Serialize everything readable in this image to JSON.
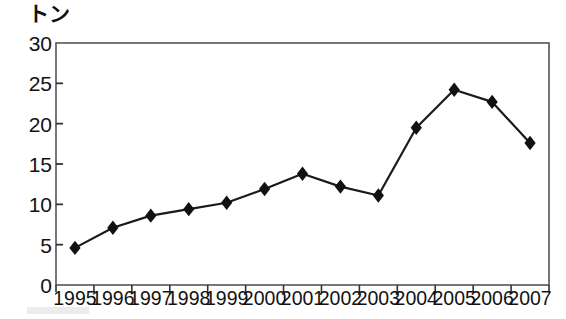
{
  "chart_data": {
    "type": "line",
    "title": "",
    "subtitle": "",
    "xlabel": "",
    "ylabel": "トン",
    "unit_label": "トン",
    "categories": [
      "1995",
      "1996",
      "1997",
      "1998",
      "1999",
      "2000",
      "2001",
      "2002",
      "2003",
      "2004",
      "2005",
      "2006",
      "2007"
    ],
    "values": [
      4.6,
      7.1,
      8.6,
      9.4,
      10.2,
      11.9,
      13.8,
      12.2,
      11.1,
      19.5,
      24.2,
      22.7,
      17.6
    ],
    "series": [
      {
        "name": "トン",
        "values": [
          4.6,
          7.1,
          8.6,
          9.4,
          10.2,
          11.9,
          13.8,
          12.2,
          11.1,
          19.5,
          24.2,
          22.7,
          17.6
        ]
      }
    ],
    "ylim": [
      0,
      30
    ],
    "yticks": [
      0,
      5,
      10,
      15,
      20,
      25,
      30
    ],
    "ytick_labels": [
      "0",
      "5",
      "10",
      "15",
      "20",
      "25",
      "30"
    ],
    "grid": false,
    "legend": false,
    "legend_position": "none",
    "marker": "diamond",
    "line_color": "#1a1a1a",
    "marker_color": "#111111",
    "frame_color": "#555555",
    "background_color": "#ffffff"
  },
  "plot_geometry": {
    "left": 56,
    "right": 549,
    "top": 43,
    "bottom": 285
  }
}
